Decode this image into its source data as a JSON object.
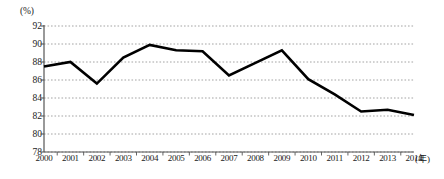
{
  "chart_data": {
    "type": "line",
    "title": "",
    "xlabel": "(年)",
    "ylabel": "(%)",
    "x": [
      2000,
      2001,
      2002,
      2003,
      2004,
      2005,
      2006,
      2007,
      2008,
      2009,
      2010,
      2011,
      2012,
      2013,
      2014
    ],
    "categories": [
      "2000",
      "2001",
      "2002",
      "2003",
      "2004",
      "2005",
      "2006",
      "2007",
      "2008",
      "2009",
      "2010",
      "2011",
      "2012",
      "2013",
      "2014"
    ],
    "values": [
      87.5,
      88.0,
      85.6,
      88.5,
      89.9,
      89.3,
      89.2,
      86.5,
      87.9,
      89.3,
      86.1,
      84.4,
      82.5,
      82.7,
      82.1
    ],
    "ylim": [
      78,
      92
    ],
    "yticks": [
      78,
      80,
      82,
      84,
      86,
      88,
      90,
      92
    ],
    "ytick_labels": [
      "78",
      "80",
      "82",
      "84",
      "86",
      "88",
      "90",
      "92"
    ],
    "xlim": [
      2000,
      2014
    ],
    "grid": true,
    "grid_style": "dotted-horizontal",
    "legend": false,
    "line_color": "#000000",
    "grid_color": "#9a9a9a",
    "axis_color": "#555555",
    "background": "#ffffff"
  },
  "axes": {
    "y_unit_label": "(%)",
    "x_unit_label": "(年)"
  }
}
